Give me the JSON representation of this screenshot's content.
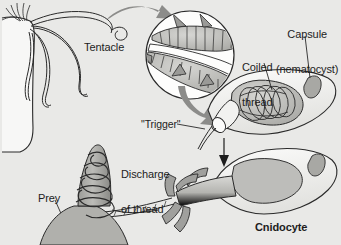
{
  "figure": {
    "background_color": "#e9e9e7",
    "ink_color": "#1d1d1d",
    "fill_light": "#f4f4f2",
    "fill_mid": "#b9b9b6",
    "fill_dark": "#8e8e8b",
    "arrow_color": "#8c8c8a"
  },
  "labels": {
    "tentacle": "Tentacle",
    "capsule_line1": "Capsule",
    "capsule_line2": "(nematocyst)",
    "coiled_line1": "Coiled",
    "coiled_line2": "thread",
    "trigger": "\"Trigger\"",
    "discharge_line1": "Discharge",
    "discharge_line2": "of thread",
    "prey": "Prey",
    "cnidocyte": "Cnidocyte"
  },
  "icons": {
    "magnify_arrow": "curved-arrow-icon",
    "return_arrow": "curved-arrow-icon",
    "down_arrow": "down-arrow-icon",
    "leader_line": "leader-line-icon"
  },
  "parts": [
    {
      "name": "hydra-body",
      "description": "cnidarian body column at upper left"
    },
    {
      "name": "tentacles",
      "description": "four wavy tentacles extending right"
    },
    {
      "name": "magnified-inset",
      "description": "circular magnification of barbed thread"
    },
    {
      "name": "undischarged-cnidocyte",
      "description": "capsule with coiled thread and nucleus"
    },
    {
      "name": "discharged-cnidocyte",
      "description": "cell after thread eversion"
    },
    {
      "name": "prey-spine",
      "description": "cone-shaped prey with thread coiled around it"
    }
  ]
}
